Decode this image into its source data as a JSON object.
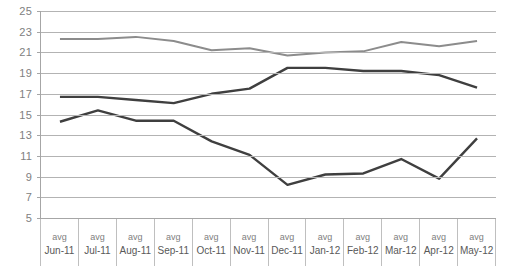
{
  "chart_data": {
    "type": "line",
    "title": "",
    "xlabel": "",
    "ylabel": "",
    "ylim": [
      5,
      25
    ],
    "ytick_step": 2,
    "yticks": [
      25,
      23,
      21,
      19,
      17,
      15,
      13,
      11,
      9,
      7,
      5
    ],
    "grid": true,
    "legend": "none",
    "category_prefix": "avg",
    "categories": [
      "Jun-11",
      "Jul-11",
      "Aug-11",
      "Sep-11",
      "Oct-11",
      "Nov-11",
      "Dec-11",
      "Jan-12",
      "Feb-12",
      "Mar-12",
      "Apr-12",
      "May-12"
    ],
    "series": [
      {
        "name": "series-1",
        "color": "#8c8c8c",
        "width": 2,
        "values": [
          22.3,
          22.3,
          22.5,
          22.1,
          21.2,
          21.4,
          20.7,
          21.0,
          21.1,
          22.0,
          21.6,
          22.1
        ]
      },
      {
        "name": "series-2",
        "color": "#3f3f3f",
        "width": 2.4,
        "values": [
          16.7,
          16.7,
          16.4,
          16.1,
          17.0,
          17.5,
          19.5,
          19.5,
          19.2,
          19.2,
          18.8,
          17.6
        ]
      },
      {
        "name": "series-3",
        "color": "#3f3f3f",
        "width": 2.4,
        "values": [
          14.3,
          15.4,
          14.4,
          14.4,
          12.4,
          11.1,
          8.2,
          9.2,
          9.3,
          10.7,
          8.8,
          12.7
        ]
      }
    ]
  },
  "colors": {
    "gridline": "#b3b3b3",
    "axis": "#a6a6a6",
    "tick_label": "#808080",
    "category_label": "#595959",
    "background": "#ffffff"
  }
}
